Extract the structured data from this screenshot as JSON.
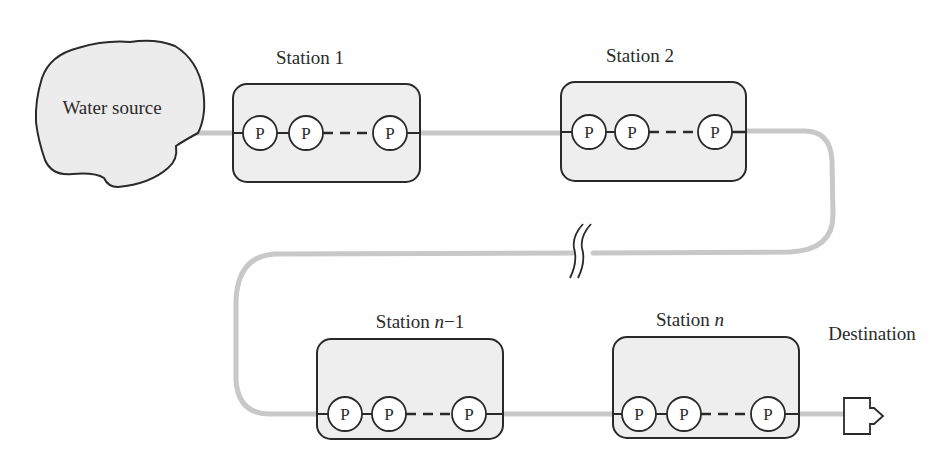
{
  "diagram": {
    "title": "",
    "source": {
      "label": "Water source"
    },
    "destination": {
      "label": "Destination"
    },
    "stations": [
      {
        "id": "station-1",
        "label_prefix": "Station",
        "label_index": "1",
        "italic_index": false,
        "pumps": [
          "P",
          "P",
          "P"
        ]
      },
      {
        "id": "station-2",
        "label_prefix": "Station",
        "label_index": "2",
        "italic_index": false,
        "pumps": [
          "P",
          "P",
          "P"
        ]
      },
      {
        "id": "station-n-1",
        "label_prefix": "Station",
        "label_index": "n",
        "label_suffix": "−1",
        "italic_index": true,
        "pumps": [
          "P",
          "P",
          "P"
        ]
      },
      {
        "id": "station-n",
        "label_prefix": "Station",
        "label_index": "n",
        "label_suffix": "",
        "italic_index": true,
        "pumps": [
          "P",
          "P",
          "P"
        ]
      }
    ],
    "pump_symbol": "P",
    "break_symbol": "pipeline-break",
    "colors": {
      "pipe": "#c8c8c8",
      "box_fill": "#eeeeee",
      "stroke": "#2a2a2a",
      "source_fill": "#ececec"
    }
  }
}
